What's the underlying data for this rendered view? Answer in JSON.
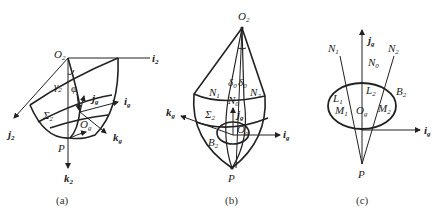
{
  "figure": {
    "panels": [
      {
        "id": "a",
        "caption": "(a)",
        "labels": {
          "origin": "O",
          "origin_sub": "2",
          "axis_i": "i",
          "axis_i_sub": "2",
          "axis_j": "j",
          "axis_j_sub": "2",
          "axis_k": "k",
          "axis_k_sub": "2",
          "gamma": "γ",
          "gamma_sub": "2",
          "phi": "φ",
          "surface": "Σ",
          "surface_sub": "2",
          "local_origin": "O",
          "local_origin_sub": "g",
          "local_i": "i",
          "local_i_sub": "g",
          "local_j": "j",
          "local_j_sub": "g",
          "local_k": "k",
          "local_k_sub": "g",
          "point": "P"
        }
      },
      {
        "id": "b",
        "caption": "(b)",
        "labels": {
          "origin": "O",
          "origin_sub": "2",
          "n1": "N",
          "n1_sub": "1",
          "n0": "N",
          "n0_sub": "0",
          "n2": "N",
          "n2_sub": "2",
          "delta_left": "δ",
          "delta_left_sub": "0",
          "delta_right": "δ",
          "delta_right_sub": "0",
          "surface": "Σ",
          "surface_sub": "2",
          "boundary": "B",
          "boundary_sub": "2",
          "local_origin": "O",
          "local_origin_sub": "g",
          "local_i": "i",
          "local_i_sub": "g",
          "local_j": "j",
          "local_j_sub": "g",
          "local_k": "k",
          "local_k_sub": "g",
          "point": "P"
        }
      },
      {
        "id": "c",
        "caption": "(c)",
        "labels": {
          "n1": "N",
          "n1_sub": "1",
          "n0": "N",
          "n0_sub": "0",
          "n2": "N",
          "n2_sub": "2",
          "local_j": "j",
          "local_j_sub": "g",
          "local_i": "i",
          "local_i_sub": "g",
          "l1": "L",
          "l1_sub": "1",
          "l2": "L",
          "l2_sub": "2",
          "m1": "M",
          "m1_sub": "1",
          "m2": "M",
          "m2_sub": "2",
          "boundary": "B",
          "boundary_sub": "2",
          "local_origin": "O",
          "local_origin_sub": "g",
          "point": "P"
        }
      }
    ]
  }
}
